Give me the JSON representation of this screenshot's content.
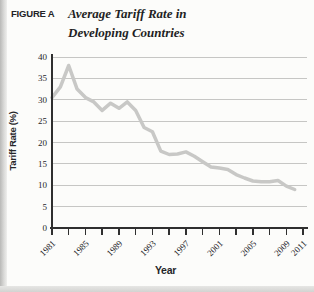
{
  "page": {
    "figure_label": "FIGURE A",
    "title_line1": "Average Tariff Rate in",
    "title_line2": "Developing Countries"
  },
  "chart_data": {
    "type": "line",
    "title": "Average Tariff Rate in Developing Countries",
    "xlabel": "Year",
    "ylabel": "Tariff Rate (%)",
    "ylim": [
      0,
      40
    ],
    "ytick_step": 5,
    "xlim": [
      1981,
      2011
    ],
    "xticks_minor_every": 2,
    "xtick_labels": [
      "1981",
      "1985",
      "1989",
      "1993",
      "1997",
      "2001",
      "2005",
      "2009",
      "2011"
    ],
    "grid": "horizontal",
    "legend": "none",
    "series": [
      {
        "name": "Average tariff rate",
        "x": [
          1981,
          1982,
          1983,
          1984,
          1985,
          1986,
          1987,
          1988,
          1989,
          1990,
          1991,
          1992,
          1993,
          1994,
          1995,
          1996,
          1997,
          1998,
          1999,
          2000,
          2001,
          2002,
          2003,
          2004,
          2005,
          2006,
          2007,
          2008,
          2009,
          2010
        ],
        "values": [
          30.5,
          33,
          38,
          32.5,
          30.5,
          29.5,
          27.5,
          29.2,
          28,
          29.5,
          27.5,
          23.5,
          22.5,
          18,
          17.2,
          17.3,
          17.8,
          16.8,
          15.5,
          14.3,
          14,
          13.7,
          12.5,
          11.7,
          11,
          10.8,
          10.8,
          11.1,
          9.8,
          9
        ]
      }
    ]
  },
  "colors": {
    "line": "#c8c8c6",
    "grid": "#c6c6c4",
    "axis": "#2f2f2f",
    "text": "#26262a",
    "page_bg": "#fcfcfa",
    "page_edge": "#c2c2c0"
  }
}
